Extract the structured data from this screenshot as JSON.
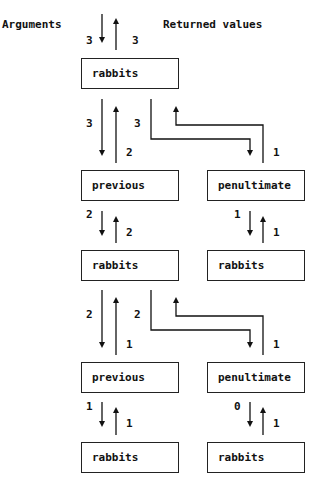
{
  "headers": {
    "arguments": "Arguments",
    "returned": "Returned values"
  },
  "boxes": [
    {
      "label": "rabbits"
    },
    {
      "label": "previous"
    },
    {
      "label": "penultimate"
    },
    {
      "label": "rabbits"
    },
    {
      "label": "rabbits"
    },
    {
      "label": "previous"
    },
    {
      "label": "penultimate"
    },
    {
      "label": "rabbits"
    },
    {
      "label": "rabbits"
    }
  ],
  "labels": {
    "top_arg": "3",
    "top_ret": "3",
    "r1_prev_arg": "3",
    "r1_prev_ret": "2",
    "r1_pen_arg": "3",
    "r1_pen_ret": "1",
    "prev1_arg": "2",
    "prev1_ret": "2",
    "pen1_arg": "1",
    "pen1_ret": "1",
    "r2_prev_arg": "2",
    "r2_prev_ret": "1",
    "r2_pen_arg": "2",
    "r2_pen_ret": "1",
    "prev2_arg": "1",
    "prev2_ret": "1",
    "pen2_arg": "0",
    "pen2_ret": "1"
  }
}
